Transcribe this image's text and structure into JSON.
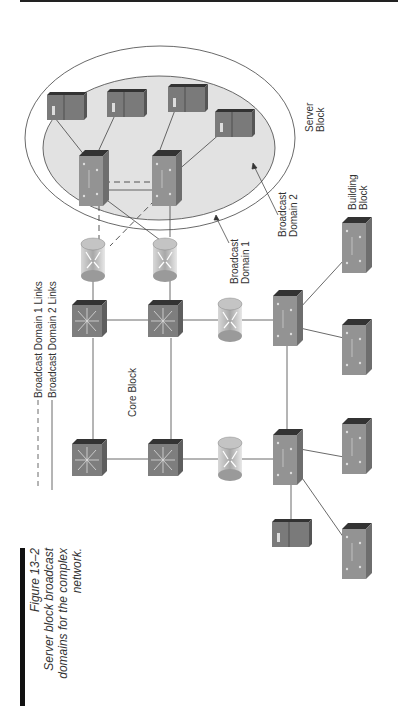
{
  "figure": {
    "number": "Figure 13–2",
    "caption_lines": [
      "Server block broadcast",
      "domains for the complex",
      "network."
    ]
  },
  "legend": {
    "items": [
      {
        "label": "Broadcast Domain 1 Links",
        "style": "dashed"
      },
      {
        "label": "Broadcast Domain 2 Links",
        "style": "solid"
      }
    ]
  },
  "labels": {
    "server_block": [
      "Server",
      "Block"
    ],
    "building_block": [
      "Building",
      "Block"
    ],
    "core_block": "Core Block",
    "broadcast_domain_1": [
      "Broadcast",
      "Domain 1"
    ],
    "broadcast_domain_2": [
      "Broadcast",
      "Domain 2"
    ]
  },
  "colors": {
    "device_front": "#8a8a8a",
    "device_side": "#6e6e6e",
    "device_top": "#3a3a3a",
    "server_front": "#7a7a7a",
    "inner_ellipse_fill": "#e2e2e2",
    "line": "#555555",
    "router_fill": "#b8b8b8"
  },
  "nodes": {
    "servers_block": [
      {
        "id": "server-1",
        "type": "server"
      },
      {
        "id": "server-2",
        "type": "server"
      },
      {
        "id": "server-3",
        "type": "server"
      },
      {
        "id": "server-4",
        "type": "server"
      }
    ],
    "server_switches": [
      {
        "id": "server-switch-1"
      },
      {
        "id": "server-switch-2"
      }
    ],
    "routers": [
      {
        "id": "router-1"
      },
      {
        "id": "router-2"
      },
      {
        "id": "router-3"
      },
      {
        "id": "router-4"
      }
    ],
    "core_switches": [
      {
        "id": "core-1"
      },
      {
        "id": "core-2"
      },
      {
        "id": "core-3"
      },
      {
        "id": "core-4"
      }
    ],
    "distribution_switches": [
      {
        "id": "dist-1"
      },
      {
        "id": "dist-2"
      }
    ],
    "access_switches": [
      {
        "id": "access-1"
      },
      {
        "id": "access-2"
      },
      {
        "id": "access-3"
      },
      {
        "id": "access-4"
      }
    ],
    "building_server": {
      "id": "building-server"
    }
  }
}
